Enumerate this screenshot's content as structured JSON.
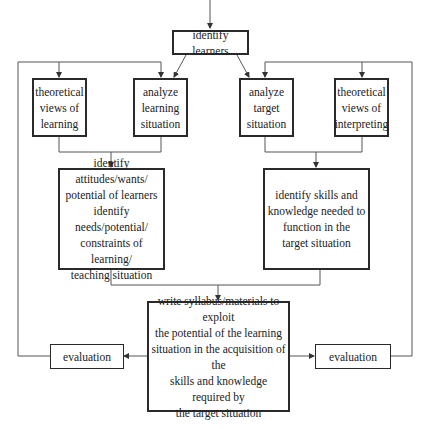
{
  "diagram": {
    "type": "flowchart",
    "nodes": {
      "identify_learners": "identify learners",
      "theory_learning": "theoretical\nviews of\nlearning",
      "analyze_learning": "analyze\nlearning\nsituation",
      "analyze_target": "analyze\ntarget\nsituation",
      "theory_interpreting": "theoretical\nviews of\ninterpreting",
      "identify_attitudes": "identify attitudes/wants/\npotential of learners\nidentify needs/potential/\nconstraints of learning/\nteaching situation",
      "identify_skills": "identify skills and\nknowledge needed to\nfunction in the\ntarget situation",
      "write_syllabus": "write syllabus/materials to exploit\nthe potential of the learning\nsituation in the acquisition of the\nskills and knowledge required by\nthe target situation",
      "evaluation_left": "evaluation",
      "evaluation_right": "evaluation"
    },
    "edges": [
      [
        "entry",
        "identify_learners"
      ],
      [
        "identify_learners",
        "analyze_learning"
      ],
      [
        "identify_learners",
        "analyze_target"
      ],
      [
        "theory_learning",
        "identify_attitudes"
      ],
      [
        "analyze_learning",
        "identify_attitudes"
      ],
      [
        "analyze_target",
        "identify_skills"
      ],
      [
        "theory_interpreting",
        "identify_skills"
      ],
      [
        "identify_attitudes",
        "write_syllabus"
      ],
      [
        "identify_skills",
        "write_syllabus"
      ],
      [
        "write_syllabus",
        "evaluation_left"
      ],
      [
        "write_syllabus",
        "evaluation_right"
      ],
      [
        "evaluation_left",
        "theory_learning"
      ],
      [
        "evaluation_left",
        "analyze_learning"
      ],
      [
        "evaluation_right",
        "analyze_target"
      ],
      [
        "evaluation_right",
        "theory_interpreting"
      ]
    ],
    "line_color": "#555555",
    "border_color": "#2a2a2a"
  }
}
